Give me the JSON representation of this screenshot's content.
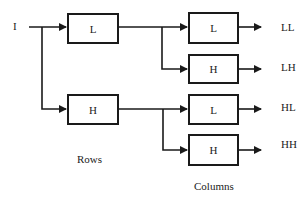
{
  "diagram": {
    "input_label": "I",
    "stage1": {
      "low_label": "L",
      "high_label": "H",
      "caption": "Rows"
    },
    "stage2": {
      "caption": "Columns",
      "filters": [
        {
          "label": "L",
          "output": "LL"
        },
        {
          "label": "H",
          "output": "LH"
        },
        {
          "label": "L",
          "output": "HL"
        },
        {
          "label": "H",
          "output": "HH"
        }
      ]
    },
    "colors": {
      "line": "#1a1a1a",
      "background": "#ffffff"
    }
  }
}
